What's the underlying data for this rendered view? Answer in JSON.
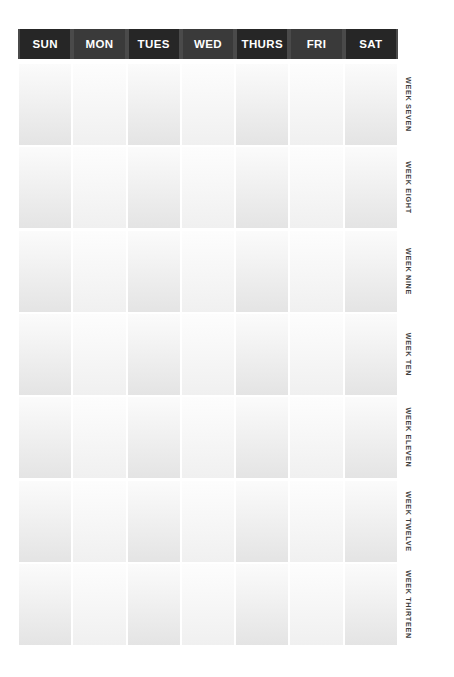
{
  "document": {
    "type": "weekly-planner-grid",
    "background_color": "#ffffff"
  },
  "header": {
    "background_color": "#262626",
    "text_color": "#ffffff",
    "days": [
      {
        "label": "SUN"
      },
      {
        "label": "MON"
      },
      {
        "label": "TUES"
      },
      {
        "label": "WED"
      },
      {
        "label": "THURS"
      },
      {
        "label": "FRI"
      },
      {
        "label": "SAT"
      }
    ]
  },
  "weeks": [
    {
      "label": "WEEK SEVEN"
    },
    {
      "label": "WEEK EIGHT"
    },
    {
      "label": "WEEK NINE"
    },
    {
      "label": "WEEK TEN"
    },
    {
      "label": "WEEK ELEVEN"
    },
    {
      "label": "WEEK TWELVE"
    },
    {
      "label": "WEEK THIRTEEN"
    }
  ],
  "cells": {
    "content": "",
    "fill_top_color": "#fbfbfb",
    "fill_bottom_color": "#e4e4e4"
  }
}
